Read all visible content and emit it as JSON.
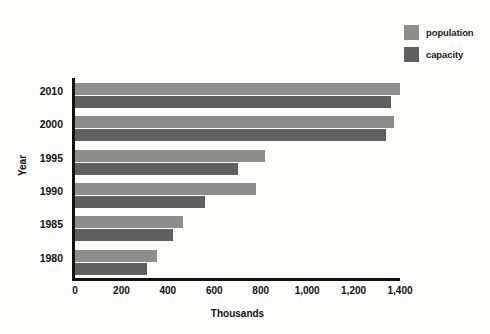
{
  "chart_data": {
    "type": "bar",
    "orientation": "horizontal",
    "title": "",
    "xlabel": "Thousands",
    "ylabel": "Year",
    "categories": [
      "2010",
      "2000",
      "1995",
      "1990",
      "1985",
      "1980"
    ],
    "series": [
      {
        "name": "population",
        "color": "#8d8d8d",
        "values": [
          1400,
          1375,
          820,
          780,
          465,
          355
        ]
      },
      {
        "name": "capacity",
        "color": "#606060",
        "values": [
          1360,
          1340,
          700,
          560,
          420,
          310
        ]
      }
    ],
    "xlim": [
      0,
      1400
    ],
    "xticks": [
      0,
      200,
      400,
      600,
      800,
      1000,
      1200,
      1400
    ],
    "xtick_labels": [
      "0",
      "200",
      "400",
      "600",
      "800",
      "1,000",
      "1,200",
      "1,400"
    ],
    "grid": false,
    "legend_position": "top-right",
    "background_color": "#fdfdfc",
    "axis_color": "#111111"
  },
  "legend": {
    "items": [
      {
        "label": "population",
        "color": "#8d8d8d"
      },
      {
        "label": "capacity",
        "color": "#606060"
      }
    ]
  },
  "axes": {
    "x_title": "Thousands",
    "y_title": "Year"
  }
}
